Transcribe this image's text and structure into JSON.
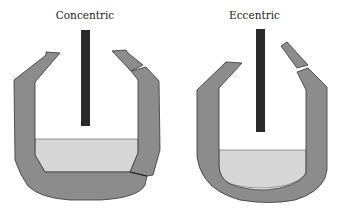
{
  "diagrams": [
    {
      "id": "concentric",
      "label": "Concentric"
    },
    {
      "id": "eccentric",
      "label": "Eccentric"
    }
  ],
  "colors": {
    "wall": "#8c8c8c",
    "wall_stroke": "#333333",
    "liquid": "#d6d6d6",
    "liquid_line": "#555555",
    "electrode": "#2a2a2a",
    "background": "#ffffff"
  }
}
